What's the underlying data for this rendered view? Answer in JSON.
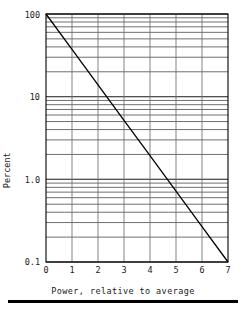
{
  "chart_data": {
    "type": "line",
    "title": "",
    "subtitle": "",
    "xlabel": "Power, relative to average",
    "ylabel": "Percent",
    "xscale": "linear",
    "yscale": "log",
    "xlim": [
      0,
      7
    ],
    "ylim": [
      0.1,
      100
    ],
    "grid": true,
    "grid_style": "semi-log graph paper (major + minor log gridlines)",
    "legend": null,
    "legend_position": "none",
    "xticks": [
      "0",
      "1",
      "2",
      "3",
      "4",
      "5",
      "6",
      "7"
    ],
    "xtick_values": [
      0,
      1,
      2,
      3,
      4,
      5,
      6,
      7
    ],
    "yticks": [
      "100",
      "10",
      "1.0",
      "0.1"
    ],
    "ytick_values": [
      100,
      10,
      1.0,
      0.1
    ],
    "y_minor_decades": [
      1,
      2,
      3,
      4,
      5,
      6,
      7,
      8,
      9
    ],
    "series": [
      {
        "name": "Percent of time power exceeds value",
        "style": "solid straight line",
        "color": "#000000",
        "x": [
          0,
          1,
          2,
          3,
          4,
          5,
          6,
          7
        ],
        "values": [
          100,
          37.3,
          13.9,
          5.18,
          1.93,
          0.72,
          0.268,
          0.1
        ],
        "points": [
          {
            "x": 0,
            "y": 100
          },
          {
            "x": 1,
            "y": 37.3
          },
          {
            "x": 2,
            "y": 13.9
          },
          {
            "x": 3,
            "y": 5.18
          },
          {
            "x": 4,
            "y": 1.93
          },
          {
            "x": 5,
            "y": 0.72
          },
          {
            "x": 6,
            "y": 0.268
          },
          {
            "x": 7,
            "y": 0.1
          }
        ]
      }
    ],
    "annotations": []
  },
  "axes": {
    "y_axis_title": "Percent",
    "x_axis_title": "Power, relative to average"
  },
  "ticks": {
    "y": [
      {
        "label": "100",
        "value": 100
      },
      {
        "label": "10",
        "value": 10
      },
      {
        "label": "1.0",
        "value": 1.0
      },
      {
        "label": "0.1",
        "value": 0.1
      }
    ],
    "x": [
      {
        "label": "0",
        "value": 0
      },
      {
        "label": "1",
        "value": 1
      },
      {
        "label": "2",
        "value": 2
      },
      {
        "label": "3",
        "value": 3
      },
      {
        "label": "4",
        "value": 4
      },
      {
        "label": "5",
        "value": 5
      },
      {
        "label": "6",
        "value": 6
      },
      {
        "label": "7",
        "value": 7
      }
    ]
  },
  "colors": {
    "background": "#ffffff",
    "frame": "#000000",
    "major_grid": "#1a1a1a",
    "minor_grid": "#555555",
    "vertical_grid": "#6e6e6e",
    "data_line": "#000000",
    "text": "#1a1a1a",
    "footer_rule": "#000000"
  },
  "footer": {
    "rule_present": true
  }
}
